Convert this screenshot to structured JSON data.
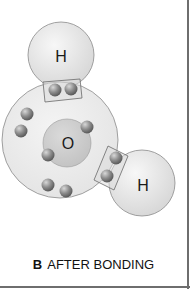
{
  "figure": {
    "caption_letter": "B",
    "caption_text": "AFTER BONDING"
  },
  "atoms": {
    "hydrogen_top": {
      "symbol": "H"
    },
    "oxygen": {
      "symbol": "O"
    },
    "hydrogen_right": {
      "symbol": "H"
    }
  },
  "electron_counts": {
    "shared_pairs": 2,
    "oxygen_outer_lone": 4,
    "oxygen_inner": 2
  },
  "colors": {
    "hydrogen_fill": "#e4e4e4",
    "shell_fill": "#ebebeb",
    "nucleus_fill": "#cfcfcf",
    "electron_fill": "#8a8a8a",
    "outline": "#7a7a7a"
  }
}
